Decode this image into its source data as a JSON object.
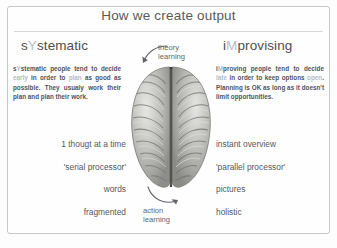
{
  "slide": {
    "title": "How we create output",
    "accent_color": "#b9bcc4",
    "text_color": "#50525a",
    "frame_color": "#c8c8c8"
  },
  "columns": {
    "left": {
      "heading_pre": "s",
      "heading_accent": "Y",
      "heading_post": "stematic",
      "paragraph_parts": [
        {
          "text": "s",
          "soft": false
        },
        {
          "text": "Y",
          "soft": true
        },
        {
          "text": "stematic people tend to decide ",
          "soft": false
        },
        {
          "text": "early",
          "soft": true
        },
        {
          "text": " in order to ",
          "soft": false
        },
        {
          "text": "plan",
          "soft": true
        },
        {
          "text": " as good as possible. They usualy work their plan and plan their work.",
          "soft": false
        }
      ],
      "paragraph_plain": "sYstematic people tend to decide early in order to plan as good as possible. They usualy work their plan and plan their work.",
      "traits": [
        "1 thougt at a time",
        "'serial processor'",
        "words",
        "fragmented"
      ]
    },
    "right": {
      "heading_pre": "i",
      "heading_accent": "M",
      "heading_post": "provising",
      "paragraph_parts": [
        {
          "text": "i",
          "soft": false
        },
        {
          "text": "M",
          "soft": true
        },
        {
          "text": "proving people tend to decide ",
          "soft": false
        },
        {
          "text": "late",
          "soft": true
        },
        {
          "text": " in order to keep options ",
          "soft": false
        },
        {
          "text": "open",
          "soft": true
        },
        {
          "text": ". Planning is OK as long as it doesn't limit opportunities.",
          "soft": false
        }
      ],
      "paragraph_plain": "iMproving people tend to decide late in order to keep options open. Planning is OK as long as it doesn't limit opportunities.",
      "traits": [
        "instant overview",
        "'parallel processor'",
        "pictures",
        "holistic"
      ]
    }
  },
  "center": {
    "image_label": "human-brain-top-view",
    "arrow_top": {
      "icon": "curved-arrow-down-left-icon",
      "caption_line1": "theory",
      "caption_line2": "learning"
    },
    "arrow_bottom": {
      "icon": "curved-arrow-up-right-icon",
      "caption_line1": "action",
      "caption_line2": "learning"
    }
  }
}
